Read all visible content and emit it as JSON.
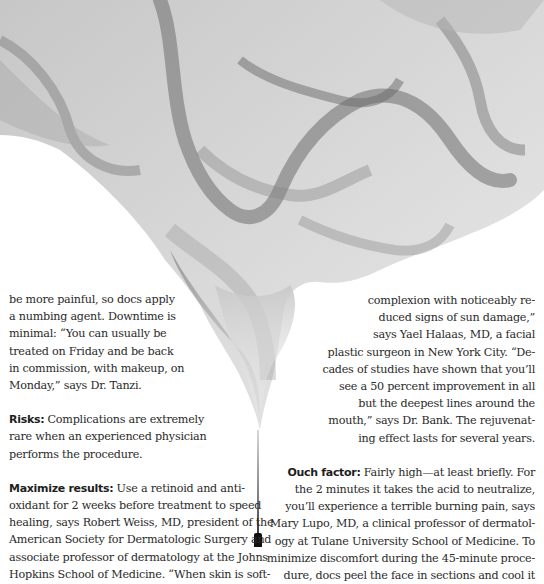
{
  "illustration": {
    "subject": "grey-smoke-plume",
    "colors": {
      "dark": "#6e6e6e",
      "mid": "#9c9c9c",
      "light": "#d6d6d6",
      "background": "#ffffff"
    }
  },
  "left_column": {
    "continued_lines": [
      "be more painful, so docs apply",
      "a numbing agent. Downtime is",
      "minimal: “You can usually be",
      "treated on Friday and be back",
      "in commission, with makeup, on",
      "Monday,” says Dr. Tanzi."
    ],
    "risks": {
      "label": "Risks:",
      "lines": [
        " Complications are extremely",
        "rare when an experienced physician",
        "performs the procedure."
      ]
    },
    "maximize": {
      "label": "Maximize results:",
      "lines": [
        " Use a retinoid and anti-",
        "oxidant for 2 weeks before treatment to speed",
        "healing, says Robert Weiss, MD, president of the",
        "American Society for Dermatologic Surgery and",
        "associate professor of dermatology at the Johns",
        "Hopkins School of Medicine. “When skin is soft-"
      ]
    }
  },
  "right_column": {
    "continued_lines": [
      "complexion with noticeably re-",
      "duced signs of sun damage,”",
      "says Yael Halaas, MD, a facial",
      "plastic surgeon in New York City. “De-",
      "cades of studies have shown that you’ll",
      "see a 50 percent improvement in all",
      "but the deepest lines around the",
      "mouth,” says Dr. Bank. The rejuvenat-",
      "ing effect lasts for several years."
    ],
    "ouch": {
      "label": "Ouch factor:",
      "lines": [
        " Fairly high—at least briefly. For",
        "the 2 minutes it takes the acid to neutralize,",
        "you’ll experience a terrible burning pain, says",
        "Mary Lupo, MD, a clinical professor of dermatol-",
        "ogy at Tulane University School of Medicine. To",
        "minimize discomfort during the 45-minute proce-",
        "dure, docs peel the face in sections and cool it"
      ]
    }
  }
}
